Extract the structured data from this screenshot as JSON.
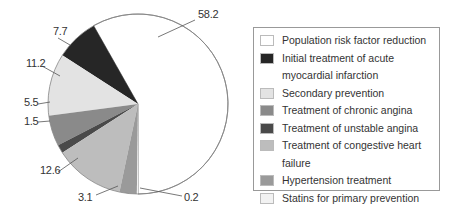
{
  "chart_data": {
    "type": "pie",
    "title": "",
    "unit": "%",
    "legend_position": "right",
    "slices": [
      {
        "label": "Population risk factor reduction",
        "value": 58.2,
        "color": "#ffffff"
      },
      {
        "label": "Initial treatment of acute myocardial infarction",
        "value": 7.7,
        "color": "#262626"
      },
      {
        "label": "Secondary prevention",
        "value": 11.2,
        "color": "#e3e3e3"
      },
      {
        "label": "Treatment of chronic angina",
        "value": 5.5,
        "color": "#8a8a8a"
      },
      {
        "label": "Treatment of unstable angina",
        "value": 1.5,
        "color": "#4a4a4a"
      },
      {
        "label": "Treatment of congestive heart failure",
        "value": 12.6,
        "color": "#bdbdbd"
      },
      {
        "label": "Hypertension treatment",
        "value": 3.1,
        "color": "#9a9a9a"
      },
      {
        "label": "Statins for primary prevention",
        "value": 0.2,
        "color": "#f2f2f2"
      }
    ],
    "data_labels": [
      "58.2",
      "7.7",
      "11.2",
      "5.5",
      "1.5",
      "12.6",
      "3.1",
      "0.2"
    ]
  },
  "legend": {
    "items": [
      {
        "label": "Population risk factor reduction",
        "color": "#ffffff"
      },
      {
        "label": "Initial treatment of acute myocardial infarction",
        "color": "#262626"
      },
      {
        "label": "Secondary prevention",
        "color": "#e3e3e3"
      },
      {
        "label": "Treatment of chronic angina",
        "color": "#8a8a8a"
      },
      {
        "label": "Treatment of unstable angina",
        "color": "#4a4a4a"
      },
      {
        "label": "Treatment of congestive heart failure",
        "color": "#bdbdbd"
      },
      {
        "label": "Hypertension treatment",
        "color": "#9a9a9a"
      },
      {
        "label": "Statins for primary prevention",
        "color": "#f2f2f2"
      }
    ]
  }
}
